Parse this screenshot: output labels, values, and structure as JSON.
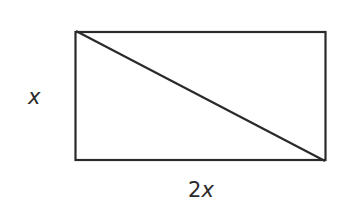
{
  "diagram": {
    "shape": "rectangle",
    "has_diagonal": true,
    "diagonal": "top-left to bottom-right",
    "labels": {
      "height": "x",
      "width_coef": "2",
      "width_var": "x"
    },
    "colors": {
      "stroke": "#2a2a2a",
      "background": "#ffffff"
    }
  }
}
